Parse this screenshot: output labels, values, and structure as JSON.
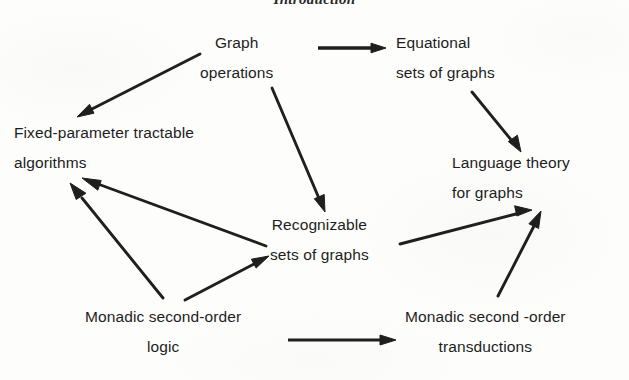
{
  "page": {
    "title_partial": "Introduction",
    "background_color": "#fdfdfc",
    "ink_color": "#1d1d1d"
  },
  "diagram": {
    "type": "directed-graph",
    "nodes": [
      {
        "id": "graph-operations",
        "lines": [
          "Graph",
          "operations"
        ],
        "x": 200,
        "y": 28
      },
      {
        "id": "equational-sets-of-graphs",
        "lines": [
          "Equational",
          "sets  of  graphs"
        ],
        "x": 396,
        "y": 28
      },
      {
        "id": "fixed-parameter-tractable-algorithms",
        "lines": [
          "Fixed-parameter tractable",
          "algorithms"
        ],
        "x": 14,
        "y": 118
      },
      {
        "id": "language-theory-for-graphs",
        "lines": [
          "Language  theory",
          "for   graphs"
        ],
        "x": 452,
        "y": 148
      },
      {
        "id": "recognizable-sets-of-graphs",
        "lines": [
          "Recognizable",
          "sets  of  graphs"
        ],
        "x": 270,
        "y": 210
      },
      {
        "id": "monadic-second-order-logic",
        "lines": [
          "Monadic  second-order",
          "logic"
        ],
        "x": 85,
        "y": 302
      },
      {
        "id": "monadic-second-order-transductions",
        "lines": [
          "Monadic  second -order",
          "transductions"
        ],
        "x": 405,
        "y": 302
      }
    ],
    "edges": [
      {
        "id": "graph-operations-to-equational-sets",
        "from": "graph-operations",
        "to": "equational-sets-of-graphs",
        "style": "straight-arrow"
      },
      {
        "id": "graph-operations-to-fixed-parameter",
        "from": "graph-operations",
        "to": "fixed-parameter-tractable-algorithms",
        "style": "straight-arrow"
      },
      {
        "id": "graph-operations-to-recognizable-sets",
        "from": "graph-operations",
        "to": "recognizable-sets-of-graphs",
        "style": "straight-arrow"
      },
      {
        "id": "equational-sets-to-language-theory",
        "from": "equational-sets-of-graphs",
        "to": "language-theory-for-graphs",
        "style": "straight-arrow"
      },
      {
        "id": "recognizable-sets-to-fixed-parameter",
        "from": "recognizable-sets-of-graphs",
        "to": "fixed-parameter-tractable-algorithms",
        "style": "straight-arrow"
      },
      {
        "id": "recognizable-sets-to-language-theory",
        "from": "recognizable-sets-of-graphs",
        "to": "language-theory-for-graphs",
        "style": "straight-arrow"
      },
      {
        "id": "mso-logic-to-fixed-parameter",
        "from": "monadic-second-order-logic",
        "to": "fixed-parameter-tractable-algorithms",
        "style": "straight-arrow"
      },
      {
        "id": "mso-logic-to-recognizable-sets",
        "from": "monadic-second-order-logic",
        "to": "recognizable-sets-of-graphs",
        "style": "straight-arrow"
      },
      {
        "id": "mso-logic-to-mso-transductions",
        "from": "monadic-second-order-logic",
        "to": "monadic-second-order-transductions",
        "style": "straight-arrow"
      },
      {
        "id": "mso-transductions-to-language-theory",
        "from": "monadic-second-order-transductions",
        "to": "language-theory-for-graphs",
        "style": "straight-arrow"
      }
    ]
  }
}
